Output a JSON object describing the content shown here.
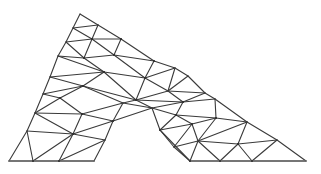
{
  "diagram": {
    "type": "triangular-mesh",
    "stroke_color": "#3a3a3a",
    "base_color": "#6a6a6a",
    "background": "#ffffff",
    "vertices": [
      [
        80,
        14
      ],
      [
        98,
        25
      ],
      [
        73,
        28
      ],
      [
        121,
        39
      ],
      [
        92,
        39
      ],
      [
        66,
        42
      ],
      [
        154,
        61
      ],
      [
        114,
        55
      ],
      [
        84,
        58
      ],
      [
        58,
        56
      ],
      [
        175,
        68
      ],
      [
        145,
        78
      ],
      [
        104,
        72
      ],
      [
        50,
        77
      ],
      [
        83,
        86
      ],
      [
        188,
        76
      ],
      [
        168,
        91
      ],
      [
        136,
        100
      ],
      [
        60,
        98
      ],
      [
        43,
        94
      ],
      [
        205,
        93
      ],
      [
        183,
        102
      ],
      [
        152,
        108
      ],
      [
        113,
        121
      ],
      [
        35,
        113
      ],
      [
        82,
        114
      ],
      [
        215,
        99
      ],
      [
        192,
        124
      ],
      [
        160,
        130
      ],
      [
        73,
        134
      ],
      [
        27,
        131
      ],
      [
        216,
        118
      ],
      [
        247,
        122
      ],
      [
        198,
        141
      ],
      [
        174,
        147
      ],
      [
        9,
        161
      ],
      [
        33,
        161
      ],
      [
        59,
        161
      ],
      [
        94,
        161
      ],
      [
        105,
        140
      ],
      [
        123,
        103
      ],
      [
        238,
        144
      ],
      [
        277,
        140
      ],
      [
        190,
        161
      ],
      [
        220,
        161
      ],
      [
        252,
        161
      ],
      [
        306,
        161
      ],
      [
        176,
        115
      ]
    ],
    "edges": [
      [
        0,
        1
      ],
      [
        0,
        2
      ],
      [
        1,
        2
      ],
      [
        1,
        3
      ],
      [
        1,
        4
      ],
      [
        2,
        4
      ],
      [
        2,
        5
      ],
      [
        3,
        4
      ],
      [
        3,
        6
      ],
      [
        3,
        7
      ],
      [
        4,
        7
      ],
      [
        4,
        8
      ],
      [
        4,
        5
      ],
      [
        5,
        8
      ],
      [
        5,
        9
      ],
      [
        7,
        8
      ],
      [
        7,
        11
      ],
      [
        7,
        6
      ],
      [
        6,
        10
      ],
      [
        6,
        11
      ],
      [
        8,
        12
      ],
      [
        8,
        9
      ],
      [
        9,
        12
      ],
      [
        9,
        13
      ],
      [
        12,
        13
      ],
      [
        12,
        11
      ],
      [
        12,
        14
      ],
      [
        13,
        14
      ],
      [
        13,
        19
      ],
      [
        10,
        15
      ],
      [
        10,
        11
      ],
      [
        10,
        16
      ],
      [
        11,
        16
      ],
      [
        11,
        17
      ],
      [
        11,
        12
      ],
      [
        12,
        17
      ],
      [
        14,
        17
      ],
      [
        14,
        18
      ],
      [
        14,
        19
      ],
      [
        18,
        19
      ],
      [
        18,
        24
      ],
      [
        19,
        24
      ],
      [
        15,
        20
      ],
      [
        15,
        16
      ],
      [
        16,
        20
      ],
      [
        16,
        21
      ],
      [
        16,
        17
      ],
      [
        17,
        21
      ],
      [
        17,
        22
      ],
      [
        17,
        40
      ],
      [
        14,
        40
      ],
      [
        18,
        25
      ],
      [
        25,
        40
      ],
      [
        18,
        14
      ],
      [
        20,
        26
      ],
      [
        20,
        21
      ],
      [
        21,
        26
      ],
      [
        21,
        47
      ],
      [
        22,
        47
      ],
      [
        21,
        22
      ],
      [
        22,
        40
      ],
      [
        22,
        23
      ],
      [
        40,
        23
      ],
      [
        25,
        23
      ],
      [
        24,
        25
      ],
      [
        24,
        29
      ],
      [
        24,
        30
      ],
      [
        25,
        29
      ],
      [
        23,
        29
      ],
      [
        26,
        31
      ],
      [
        26,
        32
      ],
      [
        31,
        32
      ],
      [
        31,
        47
      ],
      [
        47,
        27
      ],
      [
        31,
        27
      ],
      [
        22,
        28
      ],
      [
        47,
        28
      ],
      [
        27,
        28
      ],
      [
        27,
        33
      ],
      [
        31,
        33
      ],
      [
        32,
        33
      ],
      [
        32,
        41
      ],
      [
        33,
        41
      ],
      [
        28,
        34
      ],
      [
        27,
        34
      ],
      [
        33,
        34
      ],
      [
        34,
        43
      ],
      [
        33,
        43
      ],
      [
        33,
        44
      ],
      [
        41,
        44
      ],
      [
        41,
        42
      ],
      [
        32,
        42
      ],
      [
        42,
        45
      ],
      [
        41,
        45
      ],
      [
        42,
        46
      ],
      [
        44,
        45
      ],
      [
        43,
        44
      ],
      [
        45,
        46
      ],
      [
        29,
        30
      ],
      [
        29,
        39
      ],
      [
        23,
        39
      ],
      [
        30,
        35
      ],
      [
        30,
        36
      ],
      [
        29,
        36
      ],
      [
        29,
        37
      ],
      [
        36,
        37
      ],
      [
        37,
        39
      ],
      [
        39,
        38
      ],
      [
        37,
        38
      ],
      [
        35,
        36
      ],
      [
        28,
        43
      ],
      [
        22,
        28
      ]
    ],
    "base_edges": [
      [
        35,
        36
      ],
      [
        36,
        37
      ],
      [
        37,
        38
      ],
      [
        43,
        44
      ],
      [
        44,
        45
      ],
      [
        45,
        46
      ]
    ],
    "node_markers": [
      [
        121,
        39
      ],
      [
        114,
        55
      ],
      [
        92,
        39
      ],
      [
        84,
        58
      ],
      [
        104,
        72
      ],
      [
        154,
        61
      ],
      [
        145,
        78
      ],
      [
        83,
        86
      ],
      [
        60,
        98
      ],
      [
        82,
        114
      ],
      [
        136,
        100
      ],
      [
        73,
        134
      ],
      [
        183,
        102
      ],
      [
        192,
        124
      ],
      [
        216,
        118
      ],
      [
        238,
        144
      ],
      [
        252,
        161
      ],
      [
        176,
        115
      ],
      [
        160,
        130
      ],
      [
        113,
        121
      ],
      [
        33,
        161
      ],
      [
        59,
        161
      ],
      [
        190,
        161
      ],
      [
        220,
        161
      ]
    ]
  }
}
